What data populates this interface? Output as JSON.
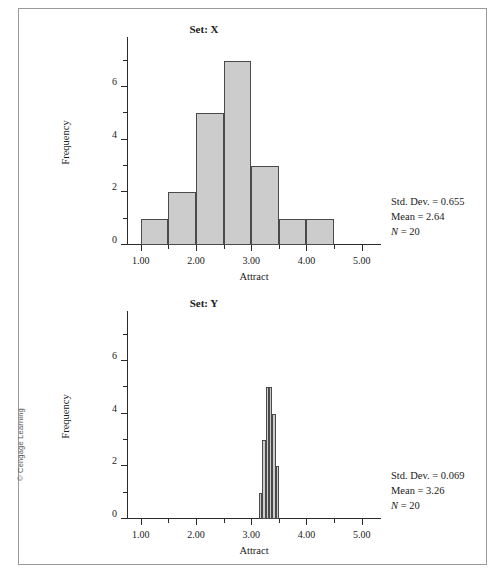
{
  "figure": {
    "copyright": "© Cengage Learning"
  },
  "chart_data": [
    {
      "type": "bar",
      "title": "Set: X",
      "xlabel": "Attract",
      "ylabel": "Frequency",
      "xlim": [
        0.75,
        5.35
      ],
      "ylim": [
        0,
        7.6
      ],
      "grid": false,
      "legend": "none",
      "bin_width": 0.5,
      "bin_starts": [
        1.0,
        1.5,
        2.0,
        2.5,
        3.0,
        3.5,
        4.0
      ],
      "categories": [
        "1.00-1.50",
        "1.50-2.00",
        "2.00-2.50",
        "2.50-3.00",
        "3.00-3.50",
        "3.50-4.00",
        "4.00-4.50"
      ],
      "values": [
        1,
        2,
        5,
        7,
        3,
        1,
        1
      ],
      "xticks": [
        1.0,
        2.0,
        3.0,
        4.0,
        5.0
      ],
      "xticklabels": [
        "1.00",
        "2.00",
        "3.00",
        "4.00",
        "5.00"
      ],
      "xminorticks": [
        1.5,
        2.5,
        3.5,
        4.5
      ],
      "yticks": [
        0,
        2,
        4,
        6
      ],
      "yticklabels": [
        "0",
        "2",
        "4",
        "6"
      ],
      "yminorticks": [
        1,
        3,
        5,
        7
      ],
      "stats": {
        "std_dev_label": "Std. Dev. = 0.655",
        "mean_label": "Mean = 2.64",
        "n_symbol": "N",
        "n_value": "= 20"
      }
    },
    {
      "type": "bar",
      "title": "Set: Y",
      "xlabel": "Attract",
      "ylabel": "Frequency",
      "xlim": [
        0.75,
        5.35
      ],
      "ylim": [
        0,
        7.6
      ],
      "grid": false,
      "legend": "none",
      "bin_width": 0.06,
      "bin_starts": [
        3.14,
        3.2,
        3.26,
        3.32,
        3.38,
        3.44
      ],
      "categories": [
        "3.14-3.20",
        "3.20-3.26",
        "3.26-3.32",
        "3.32-3.38",
        "3.38-3.44",
        "3.44-3.50"
      ],
      "values": [
        1,
        3,
        5,
        5,
        4,
        2
      ],
      "xticks": [
        1.0,
        2.0,
        3.0,
        4.0,
        5.0
      ],
      "xticklabels": [
        "1.00",
        "2.00",
        "3.00",
        "4.00",
        "5.00"
      ],
      "xminorticks": [
        1.5,
        2.5,
        3.5,
        4.5
      ],
      "yticks": [
        0,
        2,
        4,
        6
      ],
      "yticklabels": [
        "0",
        "2",
        "4",
        "6"
      ],
      "yminorticks": [
        1,
        3,
        5,
        7
      ],
      "stats": {
        "std_dev_label": "Std. Dev. = 0.069",
        "mean_label": "Mean = 3.26",
        "n_symbol": "N",
        "n_value": "= 20"
      }
    }
  ],
  "colors": {
    "bar_fill": "#cccccc",
    "bar_stroke": "#4a4a4a",
    "axis": "#2a2a2a",
    "frame": "#9a9a9a",
    "text": "#1a1a1a"
  }
}
